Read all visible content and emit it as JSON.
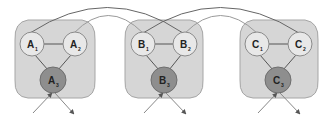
{
  "diagram": {
    "clusters": [
      {
        "id": "A",
        "nodes": [
          {
            "letter": "A",
            "sub": "1"
          },
          {
            "letter": "A",
            "sub": "2"
          },
          {
            "letter": "A",
            "sub": "3"
          }
        ]
      },
      {
        "id": "B",
        "nodes": [
          {
            "letter": "B",
            "sub": "1"
          },
          {
            "letter": "B",
            "sub": "2"
          },
          {
            "letter": "B",
            "sub": "3"
          }
        ]
      },
      {
        "id": "C",
        "nodes": [
          {
            "letter": "C",
            "sub": "1"
          },
          {
            "letter": "C",
            "sub": "2"
          },
          {
            "letter": "C",
            "sub": "3"
          }
        ]
      }
    ],
    "inter_cluster_arcs": [
      {
        "from": "A1",
        "to": "B2"
      },
      {
        "from": "A2",
        "to": "B1"
      },
      {
        "from": "B1",
        "to": "C2"
      },
      {
        "from": "B2",
        "to": "C1"
      }
    ],
    "colors": {
      "region_fill": "#d6d6d6",
      "top_node_fill": "#e8e8e8",
      "bottom_node_fill": "#8e8e8e"
    }
  }
}
